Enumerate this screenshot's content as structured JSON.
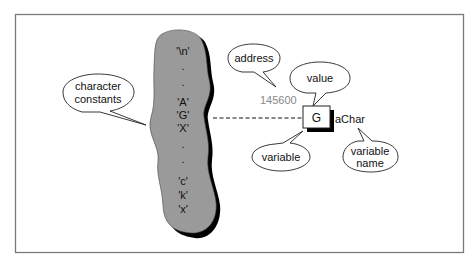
{
  "diagram": {
    "constants": {
      "label": "character constants",
      "line1": "character",
      "line2": "constants",
      "items": [
        "'\\n'",
        ".",
        ".",
        "'A'",
        "'G'",
        "'X'",
        ".",
        ".",
        "'c'",
        "'k'",
        "'x'"
      ]
    },
    "variable": {
      "address_bubble": "address",
      "address_value": "145600",
      "value_bubble": "value",
      "value": "G",
      "name": "aChar",
      "variable_bubble": "variable",
      "variable_name_bubble_line1": "variable",
      "variable_name_bubble_line2": "name"
    },
    "colors": {
      "blob_fill": "#9a9a9a",
      "shadow": "#000000",
      "address_text": "#888888",
      "frame": "#777777"
    }
  }
}
